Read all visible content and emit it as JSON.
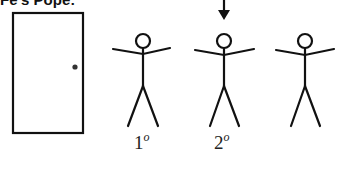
{
  "title": "Fe's Pope:",
  "figures": [
    {
      "id": 1,
      "label": "1",
      "label_sup": "o"
    },
    {
      "id": 2,
      "label": "2",
      "label_sup": "o"
    },
    {
      "id": 3,
      "label": "",
      "label_sup": ""
    }
  ],
  "colors": {
    "stroke": "#111111",
    "background": "#ffffff"
  }
}
